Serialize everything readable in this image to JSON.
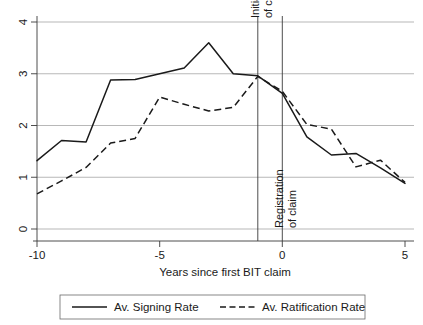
{
  "chart_data": {
    "type": "line",
    "title": "",
    "xlabel": "Years since first BIT claim",
    "ylabel": "",
    "xlim": [
      -10,
      5
    ],
    "ylim": [
      0,
      4
    ],
    "xticks": [
      -10,
      -5,
      0,
      5
    ],
    "xtick_labels": [
      "-10",
      "-5",
      "0",
      "5"
    ],
    "yticks": [
      0,
      1,
      2,
      3,
      4
    ],
    "ytick_labels": [
      "0",
      "1",
      "2",
      "3",
      "4"
    ],
    "grid": "horizontal",
    "legend_position": "bottom",
    "x": [
      -10,
      -9,
      -8,
      -7,
      -6,
      -5,
      -4,
      -3,
      -2,
      -1,
      0,
      1,
      2,
      3,
      4,
      5
    ],
    "series": [
      {
        "name": "Av. Signing Rate",
        "style": "solid",
        "values": [
          1.32,
          1.71,
          1.68,
          2.88,
          2.89,
          3.0,
          3.11,
          3.6,
          3.0,
          2.96,
          2.62,
          1.78,
          1.43,
          1.46,
          1.18,
          0.88
        ]
      },
      {
        "name": "Av. Ratification Rate",
        "style": "dashed",
        "values": [
          0.68,
          0.93,
          1.19,
          1.66,
          1.75,
          2.55,
          2.41,
          2.28,
          2.35,
          2.95,
          2.66,
          2.02,
          1.93,
          1.2,
          1.33,
          0.9
        ]
      }
    ],
    "annotations": [
      {
        "name": "initiation-of-claim",
        "x": -1,
        "line1": "Initiation",
        "line2": "of claim"
      },
      {
        "name": "registration-of-claim",
        "x": 0,
        "line1": "Registration",
        "line2": "of claim"
      }
    ],
    "colors": {
      "series_line": "#1a1a1a",
      "grid": "#9a9a9a",
      "axis": "#3a3a3a",
      "background": "#ffffff"
    }
  },
  "legend": {
    "entries": [
      {
        "label": "Av. Signing Rate",
        "style": "solid"
      },
      {
        "label": "Av. Ratification Rate",
        "style": "dashed"
      }
    ]
  },
  "axis": {
    "x_title": "Years since first BIT claim"
  }
}
